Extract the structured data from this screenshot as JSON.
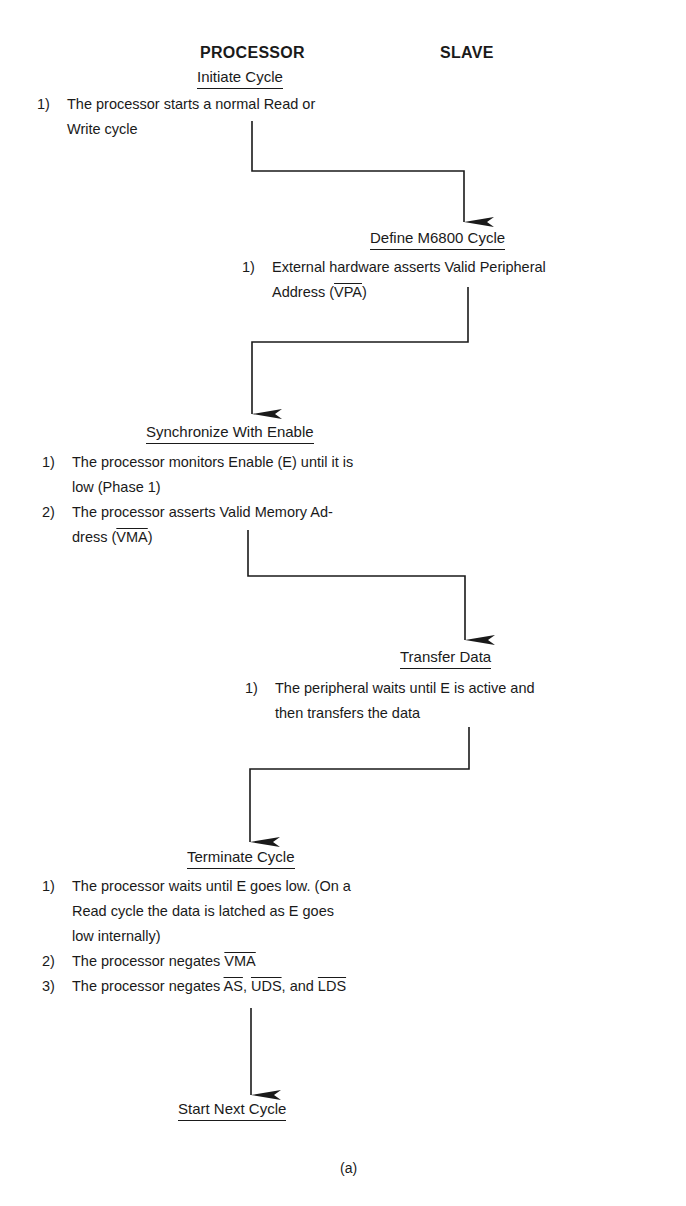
{
  "columns": {
    "processor": "PROCESSOR",
    "slave": "SLAVE"
  },
  "steps": [
    {
      "side": "processor",
      "title": "Initiate Cycle",
      "items": [
        {
          "num": "1)",
          "lines": [
            "The processor starts a normal Read or",
            "Write cycle"
          ]
        }
      ]
    },
    {
      "side": "slave",
      "title": "Define M6800 Cycle",
      "items": [
        {
          "num": "1)",
          "lines": [
            "External hardware asserts Valid Peripheral",
            "Address ("
          ],
          "signal": "VPA",
          "after": ")"
        }
      ]
    },
    {
      "side": "processor",
      "title": "Synchronize With Enable",
      "items": [
        {
          "num": "1)",
          "lines": [
            "The processor monitors Enable (E) until it is",
            "low (Phase 1)"
          ]
        },
        {
          "num": "2)",
          "lines": [
            "The processor asserts Valid Memory Ad-",
            "dress ("
          ],
          "signal": "VMA",
          "after": ")"
        }
      ]
    },
    {
      "side": "slave",
      "title": "Transfer Data",
      "items": [
        {
          "num": "1)",
          "lines": [
            "The peripheral waits until E is active and",
            "then transfers the data"
          ]
        }
      ]
    },
    {
      "side": "processor",
      "title": "Terminate Cycle",
      "items": [
        {
          "num": "1)",
          "lines": [
            "The processor waits until E goes low. (On a",
            "Read cycle the data is latched as E goes",
            "low internally)"
          ]
        },
        {
          "num": "2)",
          "text": "The processor negates ",
          "signals": [
            "VMA"
          ]
        },
        {
          "num": "3)",
          "text": "The processor negates ",
          "signals": [
            "AS",
            "UDS",
            "LDS"
          ],
          "sep1": ", ",
          "sep2": ", and "
        }
      ]
    },
    {
      "side": "processor",
      "title": "Start Next Cycle",
      "items": []
    }
  ],
  "caption": "(a)",
  "colors": {
    "ink": "#1a1a1a",
    "background": "#ffffff"
  }
}
